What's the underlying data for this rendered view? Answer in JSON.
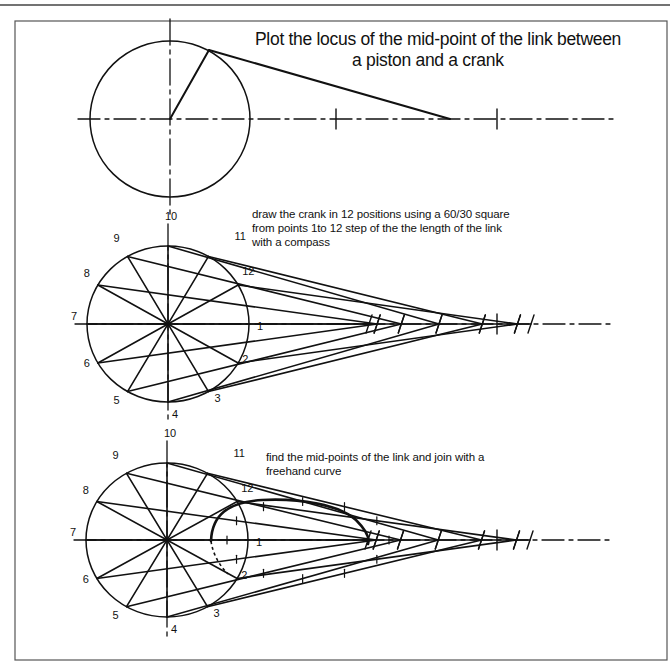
{
  "title": {
    "line1": "Plot the locus of the mid-point of the link between",
    "line2": "a piston and  a crank"
  },
  "instructions": {
    "step1": [
      "draw the crank in 12 positions  using a 60/30 square",
      "from points 1to 12 step of the the length of the link",
      "with a compass"
    ],
    "step2": [
      "find the mid-points of the link and join with a",
      "freehand  curve"
    ]
  },
  "position_labels": [
    "1",
    "2",
    "3",
    "4",
    "5",
    "6",
    "7",
    "8",
    "9",
    "10",
    "11",
    "12"
  ],
  "colors": {
    "ink": "#111111",
    "frame": "#555555",
    "background": "#ffffff"
  },
  "figures": [
    {
      "id": "setup",
      "center": [
        170,
        119
      ],
      "rx": 80,
      "ry": 78,
      "crank_end": [
        209,
        50
      ],
      "piston": [
        450,
        119
      ],
      "ticks": [
        336,
        497
      ],
      "axis_end": 613
    },
    {
      "id": "crank-positions",
      "center": [
        168,
        324
      ],
      "rx": 81,
      "ry": 78,
      "axis_end": 613,
      "ticks": [
        497
      ]
    },
    {
      "id": "locus",
      "center": [
        167,
        540
      ],
      "rx": 81,
      "ry": 77,
      "axis_end": 613,
      "ticks": [
        497
      ]
    }
  ]
}
